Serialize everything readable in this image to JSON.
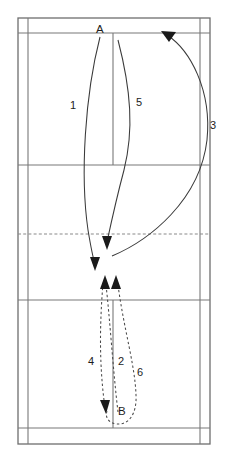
{
  "diagram": {
    "sport": "badminton",
    "background_color": "#ffffff",
    "line_color": "#787878",
    "trajectory_color": "#3a3a3a",
    "players": [
      {
        "id": "A",
        "label": "A",
        "x": 100,
        "y": 31,
        "side": "top"
      },
      {
        "id": "B",
        "label": "B",
        "x": 122,
        "y": 413,
        "side": "bottom"
      }
    ],
    "shots": [
      {
        "id": "1",
        "label": "1",
        "x": 73,
        "y": 106,
        "style": "solid",
        "direction": "down"
      },
      {
        "id": "2",
        "label": "2",
        "x": 121,
        "y": 362,
        "style": "dashed",
        "direction": "up"
      },
      {
        "id": "3",
        "label": "3",
        "x": 213,
        "y": 126,
        "style": "solid",
        "direction": "up"
      },
      {
        "id": "4",
        "label": "4",
        "x": 91,
        "y": 362,
        "style": "dashed",
        "direction": "down"
      },
      {
        "id": "5",
        "label": "5",
        "x": 139,
        "y": 103,
        "style": "solid",
        "direction": "down"
      },
      {
        "id": "6",
        "label": "6",
        "x": 140,
        "y": 373,
        "style": "dashed",
        "direction": "up"
      }
    ],
    "court": {
      "outer": {
        "left": 18,
        "top": 18,
        "right": 210,
        "bottom": 444
      },
      "singles_sidelines_x": [
        28,
        200
      ],
      "centre_line_x": 113,
      "long_service_doubles_y": [
        33,
        428
      ],
      "short_service_y": [
        165,
        300
      ],
      "net_y": 234
    }
  }
}
